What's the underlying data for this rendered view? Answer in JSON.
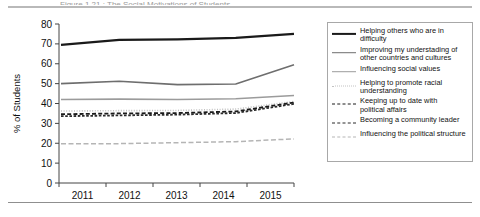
{
  "figure": {
    "title": "Figure 1.21 : The Social Motivations of Students",
    "rules": {
      "top_color": "#b9b9b9",
      "bottom_color": "#8f8f8f"
    }
  },
  "chart_data": {
    "type": "line",
    "title": "",
    "xlabel": "",
    "ylabel": "% of Students",
    "categories": [
      "2011",
      "2012",
      "2013",
      "2014",
      "2015"
    ],
    "x": [
      2011,
      2012,
      2013,
      2014,
      2015
    ],
    "ylim": [
      0,
      80
    ],
    "yticks": [
      0,
      10,
      20,
      30,
      40,
      50,
      60,
      70,
      80
    ],
    "grid": false,
    "legend_position": "right",
    "series": [
      {
        "name": "Helping others who are in difficulty",
        "values": [
          69.5,
          72.0,
          72.3,
          73.0,
          75.0
        ],
        "color": "#1a1a1a",
        "style": "solid",
        "width": 2.2
      },
      {
        "name": "Improving my understading of\nother countries and cultures",
        "values": [
          50.0,
          51.2,
          49.5,
          49.8,
          59.5
        ],
        "color": "#6e6e6e",
        "style": "solid",
        "width": 1.6
      },
      {
        "name": "Influencing social values",
        "values": [
          42.0,
          42.2,
          42.0,
          42.4,
          44.0
        ],
        "color": "#9b9b9b",
        "style": "solid",
        "width": 1.6
      },
      {
        "name": "Helping to promote racial\nunderstanding",
        "values": [
          36.2,
          36.4,
          36.5,
          37.2,
          41.0
        ],
        "color": "#c2c2c2",
        "style": "dotted",
        "width": 1.6
      },
      {
        "name": "Keeping up to date with\npolitical affairs",
        "values": [
          34.6,
          35.0,
          35.2,
          36.0,
          40.5
        ],
        "color": "#1a1a1a",
        "style": "dashed-long",
        "width": 1.8
      },
      {
        "name": "Becoming a community leader",
        "values": [
          33.6,
          34.0,
          34.4,
          35.2,
          39.8
        ],
        "color": "#2b2b2b",
        "style": "dashed-short",
        "width": 1.8
      },
      {
        "name": "Influencing the political structure",
        "values": [
          19.8,
          19.8,
          20.3,
          20.8,
          22.2
        ],
        "color": "#b5b5b5",
        "style": "dash-dot",
        "width": 1.5
      }
    ]
  },
  "legend": {
    "items": [
      {
        "label": "Helping others who are in difficulty"
      },
      {
        "label": "Improving my understading of\nother countries and cultures"
      },
      {
        "label": "Influencing social values"
      },
      {
        "label": "Helping to promote racial\nunderstanding"
      },
      {
        "label": "Keeping up to date with\npolitical affairs"
      },
      {
        "label": "Becoming a community leader"
      },
      {
        "label": "Influencing the political structure"
      }
    ]
  }
}
